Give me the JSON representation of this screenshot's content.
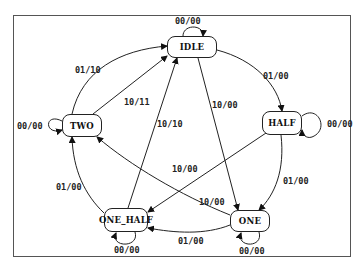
{
  "diagram": {
    "type": "state-machine",
    "states": [
      {
        "id": "IDLE",
        "label": "IDLE"
      },
      {
        "id": "TWO",
        "label": "TWO"
      },
      {
        "id": "HALF",
        "label": "HALF"
      },
      {
        "id": "ONE_HALF",
        "label": "ONE_HALF"
      },
      {
        "id": "ONE",
        "label": "ONE"
      }
    ],
    "transitions": [
      {
        "from": "IDLE",
        "to": "IDLE",
        "label": "00/00"
      },
      {
        "from": "IDLE",
        "to": "HALF",
        "label": "01/00"
      },
      {
        "from": "IDLE",
        "to": "ONE",
        "label": "10/00"
      },
      {
        "from": "TWO",
        "to": "TWO",
        "label": "00/00"
      },
      {
        "from": "TWO",
        "to": "IDLE",
        "label": "01/10"
      },
      {
        "from": "TWO",
        "to": "IDLE",
        "label": "10/11"
      },
      {
        "from": "HALF",
        "to": "HALF",
        "label": "00/00"
      },
      {
        "from": "HALF",
        "to": "ONE",
        "label": "01/00"
      },
      {
        "from": "HALF",
        "to": "ONE_HALF",
        "label": "10/00"
      },
      {
        "from": "ONE_HALF",
        "to": "ONE_HALF",
        "label": "00/00"
      },
      {
        "from": "ONE_HALF",
        "to": "IDLE",
        "label": "10/10"
      },
      {
        "from": "ONE_HALF",
        "to": "TWO",
        "label": "01/00"
      },
      {
        "from": "ONE",
        "to": "ONE",
        "label": "00/00"
      },
      {
        "from": "ONE",
        "to": "ONE_HALF",
        "label": "01/00"
      },
      {
        "from": "ONE",
        "to": "TWO",
        "label": "10/00"
      }
    ]
  }
}
